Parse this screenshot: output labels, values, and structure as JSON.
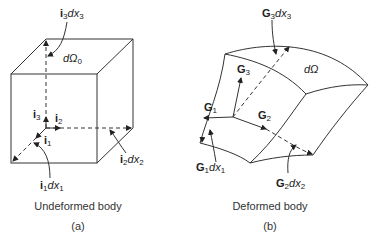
{
  "panel_a": {
    "caption": "Undeformed body",
    "sub_label": "(a)",
    "labels": {
      "i3dx3": {
        "vec": "i",
        "sub": "3",
        "dx": "dx",
        "dsub": "3"
      },
      "dOmega0": {
        "text": "dΩ",
        "sub": "0"
      },
      "i3": {
        "vec": "i",
        "sub": "3"
      },
      "i2": {
        "vec": "i",
        "sub": "2"
      },
      "i1": {
        "vec": "i",
        "sub": "1"
      },
      "i1dx1": {
        "vec": "i",
        "sub": "1",
        "dx": "dx",
        "dsub": "1"
      },
      "i2dx2": {
        "vec": "i",
        "sub": "2",
        "dx": "dx",
        "dsub": "2"
      }
    }
  },
  "panel_b": {
    "caption": "Deformed body",
    "sub_label": "(b)",
    "labels": {
      "G3dx3": {
        "vec": "G",
        "sub": "3",
        "dx": "dx",
        "dsub": "3"
      },
      "dOmega": {
        "text": "dΩ"
      },
      "G3": {
        "vec": "G",
        "sub": "3"
      },
      "G1": {
        "vec": "G",
        "sub": "1"
      },
      "G2": {
        "vec": "G",
        "sub": "2"
      },
      "G1dx1": {
        "vec": "G",
        "sub": "1",
        "dx": "dx",
        "dsub": "1"
      },
      "G2dx2": {
        "vec": "G",
        "sub": "2",
        "dx": "dx",
        "dsub": "2"
      }
    }
  }
}
